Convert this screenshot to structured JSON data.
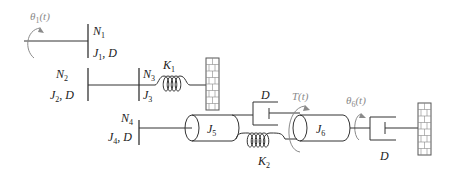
{
  "diagram": {
    "type": "rotational-mechanical-system",
    "labels": {
      "theta1": {
        "main": "θ",
        "sub": "1",
        "tail": "(t)"
      },
      "N1": {
        "main": "N",
        "sub": "1"
      },
      "J1D": {
        "main": "J",
        "sub": "1",
        "tail": ", D"
      },
      "N2": {
        "main": "N",
        "sub": "2"
      },
      "J2D": {
        "main": "J",
        "sub": "2",
        "tail": ", D"
      },
      "N3": {
        "main": "N",
        "sub": "3"
      },
      "J3": {
        "main": "J",
        "sub": "3"
      },
      "K1": {
        "main": "K",
        "sub": "1"
      },
      "N4": {
        "main": "N",
        "sub": "4"
      },
      "J4D": {
        "main": "J",
        "sub": "4",
        "tail": ", D"
      },
      "J5": {
        "main": "J",
        "sub": "5"
      },
      "D_mid": {
        "main": "D"
      },
      "K2": {
        "main": "K",
        "sub": "2"
      },
      "T": {
        "main": "T(t)"
      },
      "J6": {
        "main": "J",
        "sub": "6"
      },
      "theta6": {
        "main": "θ",
        "sub": "6",
        "tail": "(t)"
      },
      "D_right": {
        "main": "D"
      }
    },
    "components": [
      "gear N1",
      "gear N2",
      "gear N3",
      "gear N4",
      "spring K1",
      "spring K2",
      "inertia J5",
      "inertia J6",
      "damper D (between J5 and J6)",
      "damper D (J6 to ground)",
      "ground wall (K1)",
      "ground wall (right)"
    ],
    "colors": {
      "line": "#333333",
      "annotation": "#8a8a8a"
    }
  }
}
